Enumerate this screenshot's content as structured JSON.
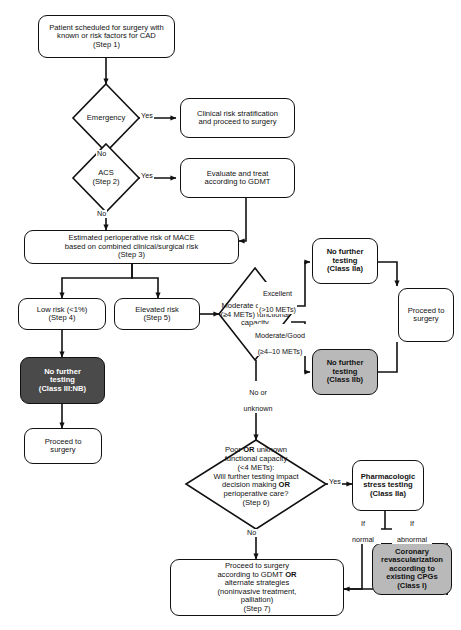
{
  "figure": {
    "caption_fragment": ""
  },
  "colors": {
    "stroke": "#111111",
    "white_fill": "#ffffff",
    "gray_fill": "#b9b9b9",
    "dark_fill": "#4a4a4a",
    "dark_text": "#ffffff"
  },
  "nodes": {
    "start": {
      "id": "start",
      "shape": "rounded-rect",
      "fill": "white",
      "line1": "Patient scheduled for surgery with",
      "line2": "known or risk factors for CAD",
      "line3": "(Step 1)"
    },
    "emergency": {
      "id": "emergency",
      "shape": "diamond",
      "fill": "white",
      "line1": "Emergency"
    },
    "clinical_risk": {
      "id": "clinical-risk-stratification",
      "shape": "rounded-rect",
      "fill": "white",
      "line1": "Clinical risk stratification",
      "line2": "and proceed to surgery"
    },
    "acs": {
      "id": "acs",
      "shape": "diamond",
      "fill": "white",
      "line1": "ACS",
      "line2": "(Step 2)"
    },
    "gdmt": {
      "id": "evaluate-treat-gdmt",
      "shape": "rounded-rect",
      "fill": "white",
      "line1": "Evaluate and treat",
      "line2": "according to GDMT"
    },
    "mace": {
      "id": "estimated-perioperative-risk",
      "shape": "rounded-rect",
      "fill": "white",
      "line1": "Estimated perioperative risk of MACE",
      "line2": "based on combined clinical/surgical risk",
      "line3": "(Step 3)"
    },
    "low_risk": {
      "id": "low-risk",
      "shape": "rounded-rect",
      "fill": "white",
      "line1": "Low risk (<1%)",
      "line2": "(Step 4)"
    },
    "elevated_risk": {
      "id": "elevated-risk",
      "shape": "rounded-rect",
      "fill": "white",
      "line1": "Elevated risk",
      "line2": "(Step 5)"
    },
    "no_testing_iiinb": {
      "id": "no-further-testing-class-iii-nb",
      "shape": "rounded-rect",
      "fill": "dark",
      "line1": "No further",
      "line2": "testing",
      "line3": "(Class III:NB)"
    },
    "proceed_left": {
      "id": "proceed-to-surgery-left",
      "shape": "rounded-rect",
      "fill": "white",
      "line1": "Proceed to",
      "line2": "surgery"
    },
    "mets": {
      "id": "moderate-or-greater-mets",
      "shape": "diamond",
      "fill": "white",
      "line1": "Moderate or greater",
      "line2": "(≥4 METs) functional",
      "line3": "capacity"
    },
    "no_testing_iia": {
      "id": "no-further-testing-class-iia",
      "shape": "rounded-rect",
      "fill": "white",
      "line1": "No further",
      "line2": "testing",
      "line3": "(Class IIa)"
    },
    "no_testing_iib": {
      "id": "no-further-testing-class-iib",
      "shape": "rounded-rect",
      "fill": "gray",
      "line1": "No further",
      "line2": "testing",
      "line3": "(Class IIb)"
    },
    "proceed_right": {
      "id": "proceed-to-surgery-right",
      "shape": "rounded-rect",
      "fill": "white",
      "line1": "Proceed to",
      "line2": "surgery"
    },
    "poor_unknown": {
      "id": "poor-or-unknown-capacity",
      "shape": "diamond",
      "fill": "white",
      "line1_a": "Poor ",
      "line1_b": "OR",
      "line1_c": " unknown",
      "line2": "functional capacity",
      "line3": "(<4 METs):",
      "line4": "Will further testing impact",
      "line5_a": "decision making ",
      "line5_b": "OR",
      "line6": "perioperative care?",
      "line7": "(Step 6)"
    },
    "pharm_stress": {
      "id": "pharmacologic-stress-testing",
      "shape": "rounded-rect",
      "fill": "white",
      "line1": "Pharmacologic",
      "line2": "stress testing",
      "line3": "(Class IIa)"
    },
    "revascularization": {
      "id": "coronary-revascularization",
      "shape": "rounded-rect",
      "fill": "gray",
      "line1": "Coronary",
      "line2": "revascularization",
      "line3": "according to",
      "line4": "existing CPGs",
      "line5": "(Class I)"
    },
    "final": {
      "id": "proceed-to-surgery-gdmt",
      "shape": "rounded-rect",
      "fill": "white",
      "line1": "Proceed to surgery",
      "line2_a": "according to GDMT ",
      "line2_b": "OR",
      "line3": "alternate strategies",
      "line4": "(noninvasive treatment,",
      "line5": "palliation)",
      "line6": "(Step 7)"
    }
  },
  "edge_labels": {
    "emergency_yes": "Yes",
    "emergency_no": "No",
    "acs_yes": "Yes",
    "acs_no": "No",
    "mets_excellent_l1": "Excellent",
    "mets_excellent_l2": "(>10 METs)",
    "mets_moderate_l1": "Moderate/Good",
    "mets_moderate_l2": "(≥4–10 METs)",
    "mets_unknown_l1": "No or",
    "mets_unknown_l2": "unknown",
    "poor_yes": "Yes",
    "poor_no": "No",
    "if_normal_l1": "If",
    "if_normal_l2": "normal",
    "if_abnormal_l1": "If",
    "if_abnormal_l2": "abnormal"
  }
}
